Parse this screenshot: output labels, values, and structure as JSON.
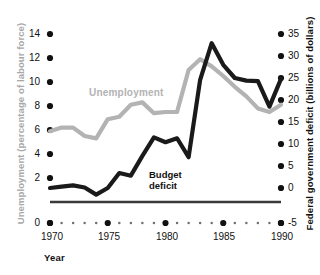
{
  "figure": {
    "top_caption": "",
    "xaxis_title": "Year",
    "left_axis_title": "Unemployment (percentage of labour force)",
    "right_axis_title": "Federal government deficit (billions of dollars)",
    "left_axis_color": "#a8a8a8",
    "right_axis_color": "#111111",
    "unemployment_color": "#b3b3b3",
    "deficit_color": "#1a1a1a",
    "label_unemployment": "Unemployment",
    "label_deficit_line1": "Budget",
    "label_deficit_line2": "deficit"
  },
  "chart_data": {
    "type": "line",
    "title": "",
    "xlabel": "Year",
    "ylabel": "Unemployment (percentage of labour force)",
    "y2label": "Federal government deficit (billions of dollars)",
    "xlim": [
      1970,
      1990
    ],
    "ylim": [
      0,
      14
    ],
    "y2lim": [
      -5,
      35
    ],
    "grid": false,
    "legend": "inline-annotations",
    "xticks": [
      1970,
      1975,
      1980,
      1985,
      1990
    ],
    "xtick_labels": [
      "1970",
      "1975",
      "1980",
      "1985",
      "1990"
    ],
    "yticks": [
      0,
      2,
      4,
      6,
      8,
      10,
      12,
      14
    ],
    "ytick_labels": [
      "0",
      "2",
      "4",
      "6",
      "8",
      "10",
      "12",
      "14"
    ],
    "y2ticks": [
      -5,
      0,
      5,
      10,
      15,
      20,
      25,
      30,
      35
    ],
    "y2tick_labels": [
      "-5",
      "0",
      "5",
      "10",
      "15",
      "20",
      "25",
      "30",
      "35"
    ],
    "x": [
      1970,
      1971,
      1972,
      1973,
      1974,
      1975,
      1976,
      1977,
      1978,
      1979,
      1980,
      1981,
      1982,
      1983,
      1984,
      1985,
      1986,
      1987,
      1988,
      1989,
      1990
    ],
    "series": [
      {
        "name": "Unemployment",
        "axis": "left",
        "color": "#b3b3b3",
        "units": "percentage of labour force",
        "values": [
          5.9,
          6.2,
          6.2,
          5.5,
          5.3,
          6.9,
          7.1,
          8.1,
          8.3,
          7.4,
          7.5,
          7.5,
          11.0,
          11.9,
          11.3,
          10.5,
          9.6,
          8.8,
          7.8,
          7.5,
          8.1
        ]
      },
      {
        "name": "Budget deficit",
        "axis": "right",
        "color": "#1a1a1a",
        "units": "billions of dollars",
        "values": [
          0.0,
          0.3,
          0.6,
          0.1,
          -1.5,
          0.0,
          3.4,
          2.8,
          7.3,
          11.5,
          10.4,
          11.3,
          7.0,
          24.6,
          32.9,
          28.0,
          25.0,
          24.4,
          24.3,
          18.5,
          24.8
        ]
      }
    ]
  }
}
